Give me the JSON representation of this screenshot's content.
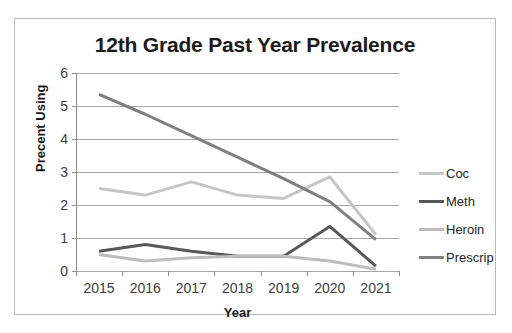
{
  "chart_data": {
    "type": "line",
    "title": "12th Grade Past Year Prevalence",
    "xlabel": "Year",
    "ylabel": "Precent Using",
    "categories": [
      "2015",
      "2016",
      "2017",
      "2018",
      "2019",
      "2020",
      "2021"
    ],
    "x": [
      2015,
      2016,
      2017,
      2018,
      2019,
      2020,
      2021
    ],
    "ylim": [
      0,
      6
    ],
    "yticks": [
      0,
      1,
      2,
      3,
      4,
      5,
      6
    ],
    "grid": true,
    "legend_position": "right",
    "series": [
      {
        "name": "Coc",
        "color": "#c6c6c6",
        "values": [
          2.5,
          2.3,
          2.7,
          2.3,
          2.2,
          2.85,
          1.1
        ]
      },
      {
        "name": "Meth",
        "color": "#585858",
        "values": [
          0.6,
          0.8,
          0.6,
          0.45,
          0.45,
          1.35,
          0.15
        ]
      },
      {
        "name": "Heroin",
        "color": "#bdbdbd",
        "values": [
          0.5,
          0.3,
          0.4,
          0.45,
          0.45,
          0.3,
          0.05
        ]
      },
      {
        "name": "Prescrip",
        "color": "#7f7f7f",
        "values": [
          5.35,
          4.75,
          4.1,
          3.45,
          2.8,
          2.1,
          0.95
        ]
      }
    ]
  },
  "legend": {
    "entries": [
      {
        "label": "Coc"
      },
      {
        "label": "Meth"
      },
      {
        "label": "Heroin"
      },
      {
        "label": "Prescrip"
      }
    ]
  }
}
